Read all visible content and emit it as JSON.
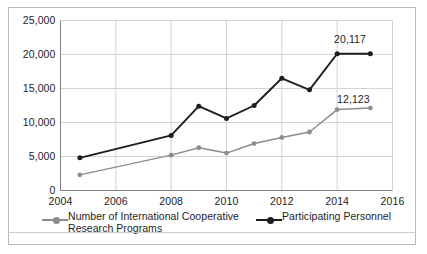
{
  "chart_data": {
    "type": "line",
    "title": "",
    "xlabel": "",
    "ylabel": "",
    "xlim": [
      2004,
      2016
    ],
    "ylim": [
      0,
      25000
    ],
    "grid": true,
    "legend_position": "bottom",
    "x": [
      2004.7,
      2008,
      2009,
      2010,
      2011,
      2012,
      2013,
      2014,
      2015.2
    ],
    "xticks": [
      "2004",
      "2006",
      "2008",
      "2010",
      "2012",
      "2014",
      "2016"
    ],
    "xtick_values": [
      2004,
      2006,
      2008,
      2010,
      2012,
      2014,
      2016
    ],
    "yticks": [
      "0",
      "5,000",
      "10,000",
      "15,000",
      "20,000",
      "25,000"
    ],
    "ytick_values": [
      0,
      5000,
      10000,
      15000,
      20000,
      25000
    ],
    "series": [
      {
        "name": "Participating Personnel",
        "color": "#1d1d1d",
        "values": [
          4800,
          8100,
          12400,
          10600,
          12500,
          16500,
          14800,
          20117,
          20117
        ],
        "end_label": "20,117"
      },
      {
        "name": "Number of International Cooperative Research Programs",
        "color": "#8c8c8c",
        "values": [
          2300,
          5200,
          6300,
          5500,
          6900,
          7800,
          8600,
          11900,
          12123
        ],
        "end_label": "12,123"
      }
    ],
    "annotations": [
      {
        "text": "20,117",
        "series": "Participating Personnel"
      },
      {
        "text": "12,123",
        "series": "Number of International Cooperative Research Programs"
      }
    ]
  },
  "legend": {
    "entries": [
      {
        "label_line1": "Number of International Cooperative",
        "label_line2": "Research Programs",
        "color": "#8c8c8c"
      },
      {
        "label_line1": "Participating Personnel",
        "label_line2": "",
        "color": "#1d1d1d"
      }
    ]
  },
  "colors": {
    "series_dark": "#1d1d1d",
    "series_gray": "#8c8c8c",
    "grid": "#d3d3d3",
    "axis": "#808080",
    "frame": "#b9b9b9",
    "background": "#ffffff"
  }
}
